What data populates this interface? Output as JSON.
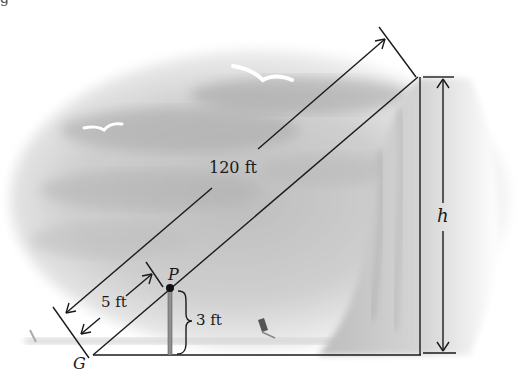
{
  "figure": {
    "type": "right-triangle similar-triangles diagram (cliff height problem)",
    "caption_fragment": "g"
  },
  "labels": {
    "hypotenuse_length": "120 ft",
    "short_hypotenuse_length": "5 ft",
    "pole_height": "3 ft",
    "cliff_height": "h",
    "ground_point": "G",
    "pole_top_point": "P"
  },
  "geometry": {
    "G": [
      93,
      355
    ],
    "P": [
      170,
      288
    ],
    "pole_base": [
      170,
      355
    ],
    "cliff_top": [
      418,
      77
    ],
    "cliff_base": [
      421,
      355
    ]
  },
  "scene": {
    "background_elements": [
      "cloudy sky",
      "seagull-large",
      "seagull-small",
      "sailboat",
      "sea horizon",
      "rocky cliff"
    ]
  },
  "colors": {
    "line": "#1a1a1a",
    "pole": "#8a8a8a",
    "sky_dark": "#9a9a9a",
    "sky_light": "#e6e6e6",
    "cliff": "#c8c8c8"
  }
}
